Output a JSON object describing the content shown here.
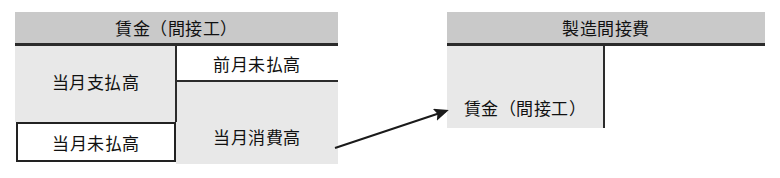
{
  "diagram": {
    "type": "t-account-flow",
    "accounts": [
      {
        "id": "wages-indirect-labor",
        "header": "賃金（間接工）",
        "cells": [
          {
            "id": "current-paid",
            "label": "当月支払高",
            "side": "debit",
            "fill": "gray",
            "boxed": false
          },
          {
            "id": "current-unpaid",
            "label": "当月未払高",
            "side": "debit",
            "fill": "white",
            "boxed": true
          },
          {
            "id": "prev-unpaid",
            "label": "前月未払高",
            "side": "credit",
            "fill": "white",
            "boxed": false
          },
          {
            "id": "current-consumed",
            "label": "当月消費高",
            "side": "credit",
            "fill": "gray",
            "boxed": false
          }
        ]
      },
      {
        "id": "manufacturing-overhead",
        "header": "製造間接費",
        "cells": [
          {
            "id": "wages-indirect",
            "label": "賃金（間接工）",
            "side": "debit",
            "fill": "gray",
            "boxed": false
          }
        ]
      }
    ],
    "connector": {
      "id": "consumed-to-overhead",
      "kind": "arrow",
      "from": "current-consumed",
      "to": "wages-indirect",
      "label": ""
    },
    "colors": {
      "header_fill": "#c9c9c9",
      "cell_gray_fill": "#e8e8e8",
      "cell_white_fill": "#ffffff",
      "rule": "#2b2b2b",
      "text": "#111111",
      "arrow": "#1a1a1a"
    }
  }
}
